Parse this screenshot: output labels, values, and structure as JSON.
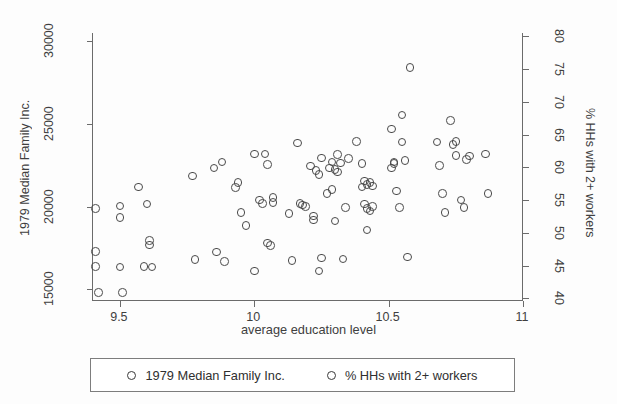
{
  "chart_data": {
    "type": "scatter",
    "title": "",
    "xlabel": "average education level",
    "ylabel": "1979 Median Family Inc.",
    "y2label": "% HHs with 2+ workers",
    "xlim": [
      9.4,
      11.0
    ],
    "ylim": [
      14300,
      30500
    ],
    "y2lim": [
      39.6,
      80.5
    ],
    "xticks": [
      "9.5",
      "10",
      "10.5",
      "11"
    ],
    "xtick_values": [
      9.5,
      10,
      10.5,
      11
    ],
    "yticks": [
      "15000",
      "20000",
      "25000",
      "30000"
    ],
    "ytick_values": [
      15000,
      20000,
      25000,
      30000
    ],
    "y2ticks": [
      "40",
      "45",
      "50",
      "55",
      "60",
      "65",
      "70",
      "75",
      "80"
    ],
    "y2tick_values": [
      40,
      45,
      50,
      55,
      60,
      65,
      70,
      75,
      80
    ],
    "grid": false,
    "legend_position": "bottom",
    "marker": "open-circle",
    "marker_color": "#4a4a4a",
    "series": [
      {
        "name": "1979 Median Family Inc.",
        "axis": "left",
        "points": [
          [
            9.41,
            19900
          ],
          [
            9.41,
            17300
          ],
          [
            9.41,
            16400
          ],
          [
            9.42,
            14800
          ],
          [
            9.5,
            20050
          ],
          [
            9.5,
            19350
          ],
          [
            9.5,
            16350
          ],
          [
            9.51,
            14800
          ],
          [
            9.57,
            21200
          ],
          [
            9.59,
            16400
          ],
          [
            9.6,
            20150
          ],
          [
            9.61,
            17950
          ],
          [
            9.61,
            17700
          ],
          [
            9.62,
            16350
          ],
          [
            9.77,
            21850
          ],
          [
            9.78,
            16800
          ],
          [
            9.85,
            22350
          ],
          [
            9.86,
            17250
          ],
          [
            9.88,
            22700
          ],
          [
            9.89,
            16700
          ],
          [
            9.93,
            21150
          ],
          [
            9.94,
            21450
          ],
          [
            9.95,
            19650
          ],
          [
            9.97,
            18850
          ],
          [
            10.0,
            23200
          ],
          [
            10.0,
            16100
          ],
          [
            10.02,
            20400
          ],
          [
            10.03,
            20200
          ],
          [
            10.04,
            23200
          ],
          [
            10.05,
            17800
          ],
          [
            10.05,
            22550
          ],
          [
            10.06,
            17650
          ],
          [
            10.07,
            20550
          ],
          [
            10.07,
            20250
          ],
          [
            10.13,
            19600
          ],
          [
            10.14,
            16750
          ],
          [
            10.16,
            23850
          ],
          [
            10.17,
            20200
          ],
          [
            10.18,
            20100
          ],
          [
            10.19,
            20000
          ],
          [
            10.21,
            22450
          ],
          [
            10.22,
            19450
          ],
          [
            10.22,
            19200
          ],
          [
            10.23,
            22200
          ],
          [
            10.24,
            21950
          ],
          [
            10.24,
            16100
          ],
          [
            10.25,
            22950
          ],
          [
            10.25,
            16900
          ],
          [
            10.27,
            20800
          ],
          [
            10.28,
            22350
          ],
          [
            10.29,
            22700
          ],
          [
            10.29,
            21050
          ],
          [
            10.3,
            19150
          ],
          [
            10.3,
            22250
          ],
          [
            10.31,
            23150
          ],
          [
            10.31,
            22100
          ],
          [
            10.32,
            22650
          ],
          [
            10.33,
            16850
          ],
          [
            10.34,
            19950
          ],
          [
            10.35,
            22900
          ],
          [
            10.38,
            23950
          ],
          [
            10.4,
            22600
          ],
          [
            10.4,
            21200
          ],
          [
            10.41,
            21550
          ],
          [
            10.41,
            20150
          ],
          [
            10.42,
            19900
          ],
          [
            10.42,
            21350
          ],
          [
            10.42,
            18600
          ],
          [
            10.43,
            21450
          ],
          [
            10.43,
            19750
          ],
          [
            10.44,
            20000
          ],
          [
            10.44,
            21250
          ],
          [
            10.51,
            24700
          ],
          [
            10.51,
            22350
          ],
          [
            10.52,
            22600
          ],
          [
            10.52,
            22700
          ],
          [
            10.53,
            20950
          ],
          [
            10.54,
            19950
          ],
          [
            10.55,
            25550
          ],
          [
            10.55,
            23900
          ],
          [
            10.56,
            22800
          ],
          [
            10.57,
            16950
          ],
          [
            10.58,
            28400
          ],
          [
            10.68,
            23900
          ],
          [
            10.69,
            22500
          ],
          [
            10.7,
            20800
          ],
          [
            10.71,
            19650
          ],
          [
            10.73,
            25200
          ],
          [
            10.74,
            23750
          ],
          [
            10.75,
            23100
          ],
          [
            10.75,
            23950
          ],
          [
            10.77,
            20400
          ],
          [
            10.78,
            19950
          ],
          [
            10.79,
            22850
          ],
          [
            10.8,
            23050
          ],
          [
            10.86,
            23200
          ],
          [
            10.87,
            20800
          ]
        ]
      },
      {
        "name": "% HHs with 2+ workers",
        "axis": "right",
        "points": []
      }
    ]
  },
  "axes": {
    "left_title": "1979 Median Family Inc.",
    "right_title": "% HHs with 2+ workers",
    "x_title": "average education level"
  },
  "legend": {
    "items": [
      {
        "label": "1979 Median Family Inc.",
        "marker": "open-circle-marker"
      },
      {
        "label": "% HHs with 2+ workers",
        "marker": "open-circle-marker"
      }
    ]
  }
}
